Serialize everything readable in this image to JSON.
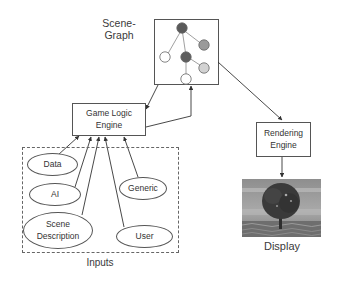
{
  "diagram": {
    "scene_graph": {
      "label_line1": "Scene-",
      "label_line2": "Graph",
      "nodes": [
        {
          "id": "root",
          "fill": "#5a5a5a"
        },
        {
          "id": "left-child",
          "fill": "#ffffff"
        },
        {
          "id": "middle-child",
          "fill": "#5e5e5e"
        },
        {
          "id": "right-child",
          "fill": "#9a9a9a"
        },
        {
          "id": "mid-right-grandchild",
          "fill": "#d2d2d2"
        },
        {
          "id": "bottom-grandchild",
          "fill": "#ffffff"
        }
      ]
    },
    "game_logic_engine": {
      "line1": "Game Logic",
      "line2": "Engine"
    },
    "rendering_engine": {
      "line1": "Rendering",
      "line2": "Engine"
    },
    "display": {
      "label": "Display",
      "image_description": "tree rendering"
    },
    "inputs": {
      "label": "Inputs",
      "items": [
        {
          "line1": "Data",
          "line2": ""
        },
        {
          "line1": "AI",
          "line2": ""
        },
        {
          "line1": "Generic",
          "line2": ""
        },
        {
          "line1": "Scene",
          "line2": "Description"
        },
        {
          "line1": "User",
          "line2": ""
        }
      ]
    },
    "colors": {
      "stroke": "#555555",
      "text": "#333333"
    }
  }
}
